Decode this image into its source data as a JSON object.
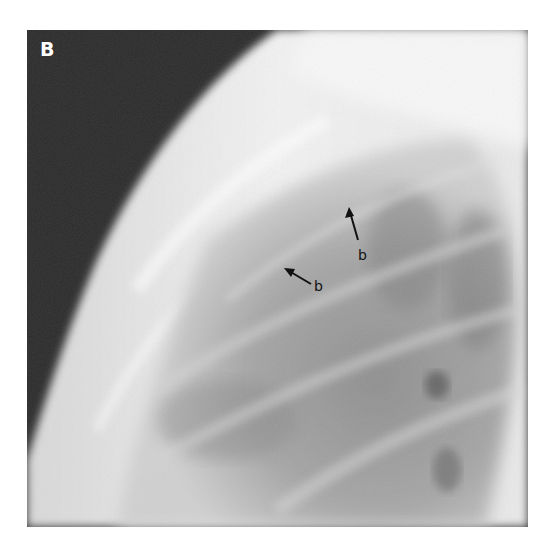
{
  "figure": {
    "panel_label": "B",
    "colors": {
      "background_dark": "#2a2a2a",
      "soft_tissue": "#e6e6e6",
      "lung_field": "#9a9a9a",
      "arrow": "#111111",
      "panel_label": "#ffffff"
    },
    "annotations": [
      {
        "label": "b",
        "arrow_tip": [
          350,
          210
        ],
        "arrow_tail": [
          358,
          240
        ],
        "text_pos": [
          362,
          255
        ]
      },
      {
        "label": "b",
        "arrow_tip": [
          285,
          269
        ],
        "arrow_tail": [
          311,
          284
        ],
        "text_pos": [
          318,
          286
        ]
      }
    ]
  }
}
